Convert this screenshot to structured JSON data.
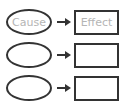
{
  "diagram": {
    "type": "cause-effect-organizer",
    "rows": [
      {
        "cause": "Cause",
        "effect": "Effect"
      },
      {
        "cause": "",
        "effect": ""
      },
      {
        "cause": "",
        "effect": ""
      }
    ]
  }
}
